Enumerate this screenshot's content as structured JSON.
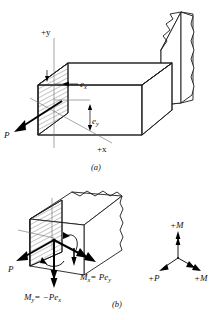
{
  "figure": {
    "panels": [
      {
        "id": "a",
        "caption": "(a)",
        "description": "Cantilever bar fixed in wall with eccentric load P applied at offsets e_x and e_y",
        "labels": {
          "axis_y": "+y",
          "axis_x": "+x",
          "load": "P",
          "ecc_x": "e",
          "ecc_x_sub": "x",
          "ecc_y": "e",
          "ecc_y_sub": "y"
        }
      },
      {
        "id": "b",
        "caption": "(b)",
        "description": "Equivalent force-couple system at the centroid of the cross section",
        "labels": {
          "load": "P",
          "moment_x": "M",
          "moment_x_sub": "x",
          "moment_x_eq": "= Pe",
          "moment_x_eq_sub": "y",
          "moment_y": "M",
          "moment_y_sub": "y",
          "moment_y_eq": "= −Pe",
          "moment_y_eq_sub": "x"
        }
      }
    ],
    "sign_convention": {
      "name": "positive-sign-convention-key",
      "up_label": "+M",
      "left_label": "+P",
      "right_label": "+M"
    },
    "colors": {
      "ink": "#1a1a1a",
      "thin_ink": "#3a3a3a",
      "axis": "#6a6a6a",
      "background": "#ffffff"
    }
  }
}
